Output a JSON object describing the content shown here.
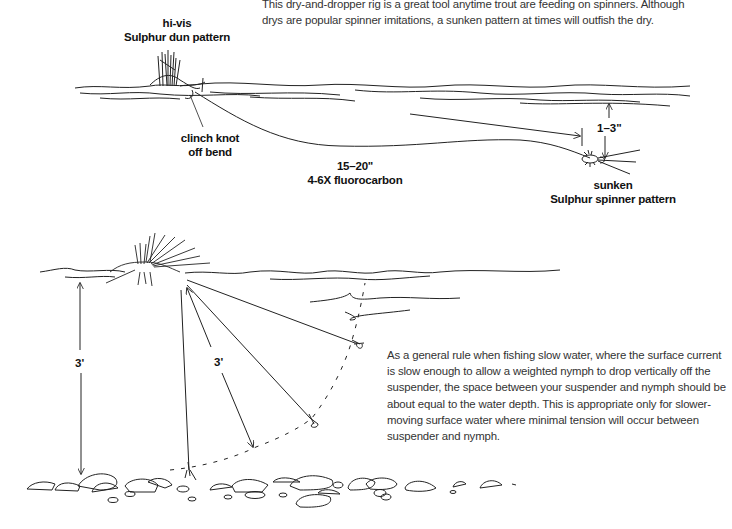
{
  "top_diagram": {
    "caption": "This dry-and-dropper rig is a great tool anytime trout are feeding on spinners. Although drys are popular spinner imitations, a sunken pattern at times will outfish the dry.",
    "caption_lines": [
      "This dry-and-dropper rig is a great tool anytime trout are feeding on spinners. Although",
      "drys are popular spinner imitations, a sunken pattern at times will outfish the dry."
    ],
    "labels": {
      "dry_fly": [
        "hi-vis",
        "Sulphur dun pattern"
      ],
      "knot": [
        "clinch knot",
        "off bend"
      ],
      "tippet": [
        "15–20\"",
        "4-6X fluorocarbon"
      ],
      "depth": "1–3\"",
      "dropper_fly": [
        "sunken",
        "Sulphur spinner pattern"
      ]
    }
  },
  "bottom_diagram": {
    "caption_lines": [
      "As a general rule when fishing slow water, where the surface current",
      "is slow enough to allow a weighted nymph to drop vertically off the",
      "suspender, the space between your suspender and nymph should be",
      "about equal to the water depth. This is appropriate only for slower-",
      "moving surface water where minimal tension will occur between",
      "suspender and nymph."
    ],
    "labels": {
      "water_depth": "3'",
      "line_length": "3'"
    }
  },
  "icons": {
    "dry_fly": "dry-fly-icon",
    "spinner_fly": "spinner-fly-icon",
    "suspender": "suspender-fly-icon",
    "nymph": "nymph-icon",
    "rocks": "riverbed-rocks-icon"
  }
}
